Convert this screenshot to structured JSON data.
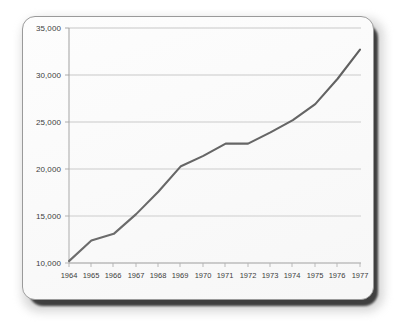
{
  "figure": {
    "card_background": "#fdfdfd",
    "border_color": "#9a9a9a",
    "shadow_color": "#2b2b2b"
  },
  "chart_data": {
    "type": "line",
    "title": "",
    "subtitle": "",
    "xlabel": "",
    "ylabel": "",
    "x": [
      1964,
      1965,
      1966,
      1967,
      1968,
      1969,
      1970,
      1971,
      1972,
      1973,
      1974,
      1975,
      1976,
      1977
    ],
    "categories": [
      "1964",
      "1965",
      "1966",
      "1967",
      "1968",
      "1969",
      "1970",
      "1971",
      "1972",
      "1973",
      "1974",
      "1975",
      "1976",
      "1977"
    ],
    "values": [
      10200,
      12400,
      13100,
      15200,
      17600,
      20300,
      21400,
      22700,
      22700,
      23900,
      25200,
      26900,
      29600,
      32700
    ],
    "series": [
      {
        "name": "series-1",
        "color": "#4a4a4a",
        "values": [
          10200,
          12400,
          13100,
          15200,
          17600,
          20300,
          21400,
          22700,
          22700,
          23900,
          25200,
          26900,
          29600,
          32700
        ]
      }
    ],
    "ylim": [
      10000,
      35000
    ],
    "yticks": [
      10000,
      15000,
      20000,
      25000,
      30000,
      35000
    ],
    "ytick_labels": [
      "10,000",
      "15,000",
      "20,000",
      "25,000",
      "30,000",
      "35,000"
    ],
    "xlim": [
      1964,
      1977
    ],
    "grid": "horizontal",
    "grid_color": "#b6b6b6",
    "axis_color": "#9d9d9d",
    "legend": "none",
    "annotations": []
  }
}
